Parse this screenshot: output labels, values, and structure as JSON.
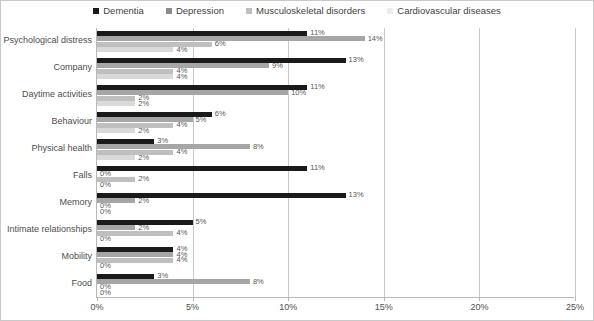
{
  "chart_data": {
    "type": "bar",
    "orientation": "horizontal",
    "title": "",
    "subtitle": "",
    "xlabel": "",
    "ylabel": "",
    "xlim": [
      0,
      25
    ],
    "xunit": "%",
    "xticks": [
      "0%",
      "5%",
      "10%",
      "15%",
      "20%",
      "25%"
    ],
    "xtick_values": [
      0,
      5,
      10,
      15,
      20,
      25
    ],
    "grid": true,
    "legend_position": "top-center",
    "categories": [
      "Psychological distress",
      "Company",
      "Daytime activities",
      "Behaviour",
      "Physical health",
      "Falls",
      "Memory",
      "Intimate relationships",
      "Mobility",
      "Food"
    ],
    "series": [
      {
        "name": "Dementia",
        "color": "#1a1a1a",
        "values": [
          11,
          13,
          11,
          6,
          3,
          11,
          13,
          5,
          4,
          3
        ],
        "labels": [
          "11%",
          "13%",
          "11%",
          "6%",
          "3%",
          "11%",
          "13%",
          "5%",
          "4%",
          "3%"
        ]
      },
      {
        "name": "Cardiovascular diseases",
        "color": "#a6a6a6",
        "values": [
          14,
          9,
          10,
          5,
          8,
          0,
          2,
          2,
          4,
          8
        ],
        "labels": [
          "14%",
          "9%",
          "10%",
          "5%",
          "8%",
          "0%",
          "2%",
          "2%",
          "4%",
          "8%"
        ]
      },
      {
        "name": "Musculoskeletal disorders",
        "color": "#bfbfbf",
        "values": [
          6,
          4,
          2,
          4,
          4,
          2,
          0,
          4,
          4,
          0
        ],
        "labels": [
          "6%",
          "4%",
          "2%",
          "4%",
          "4%",
          "2%",
          "0%",
          "4%",
          "4%",
          "0%"
        ]
      },
      {
        "name": "Depression",
        "color": "#d9d9d9",
        "values": [
          4,
          4,
          2,
          2,
          2,
          0,
          0,
          0,
          0,
          0
        ],
        "labels": [
          "4%",
          "4%",
          "2%",
          "2%",
          "2%",
          "0%",
          "0%",
          "0%",
          "0%",
          "0%"
        ]
      }
    ]
  },
  "legend": {
    "entries": [
      {
        "label": "Dementia",
        "color": "#1a1a1a"
      },
      {
        "label": "Depression",
        "color": "#8c8c8c"
      },
      {
        "label": "Musculoskeletal disorders",
        "color": "#bfbfbf"
      },
      {
        "label": "Cardiovascular diseases",
        "color": "#ececec"
      }
    ]
  }
}
